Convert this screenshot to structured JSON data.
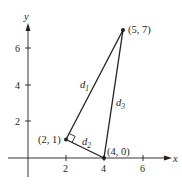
{
  "figure": {
    "axes": {
      "x_label": "x",
      "y_label": "y",
      "x_ticks": [
        "2",
        "4",
        "6"
      ],
      "y_ticks": [
        "2",
        "4",
        "6"
      ]
    },
    "points": [
      {
        "label": "(2, 1)",
        "x": 2,
        "y": 1
      },
      {
        "label": "(4, 0)",
        "x": 4,
        "y": 0
      },
      {
        "label": "(5, 7)",
        "x": 5,
        "y": 7
      }
    ],
    "segments": [
      {
        "name": "d",
        "sub": "1",
        "from": "(2, 1)",
        "to": "(5, 7)"
      },
      {
        "name": "d",
        "sub": "2",
        "from": "(2, 1)",
        "to": "(4, 0)"
      },
      {
        "name": "d",
        "sub": "3",
        "from": "(4, 0)",
        "to": "(5, 7)"
      }
    ],
    "right_angle_at": "(2, 1)",
    "colors": {
      "ink": "#231f20"
    }
  }
}
